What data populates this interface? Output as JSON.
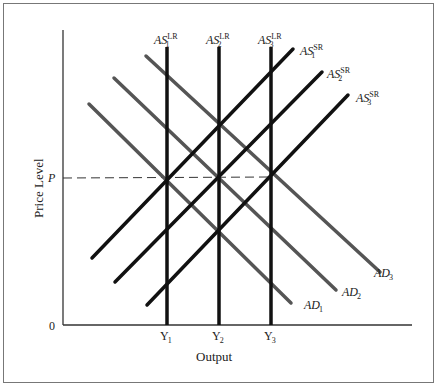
{
  "diagram": {
    "type": "AD-AS model",
    "y_axis_title": "Price Level",
    "x_axis_title": "Output",
    "origin_label": "0",
    "price_label": "P",
    "output_ticks": [
      {
        "base": "Y",
        "sub": "1"
      },
      {
        "base": "Y",
        "sub": "2"
      },
      {
        "base": "Y",
        "sub": "3"
      }
    ],
    "long_run_supply": [
      {
        "base": "AS",
        "sub": "1",
        "sup": "LR"
      },
      {
        "base": "AS",
        "sub": "2",
        "sup": "LR"
      },
      {
        "base": "AS",
        "sub": "3",
        "sup": "LR"
      }
    ],
    "short_run_supply": [
      {
        "base": "AS",
        "sub": "1",
        "sup": "SR"
      },
      {
        "base": "AS",
        "sub": "2",
        "sup": "SR"
      },
      {
        "base": "AS",
        "sub": "3",
        "sup": "SR"
      }
    ],
    "aggregate_demand": [
      {
        "base": "AD",
        "sub": "1"
      },
      {
        "base": "AD",
        "sub": "2"
      },
      {
        "base": "AD",
        "sub": "3"
      }
    ],
    "colors": {
      "supply_lines": "#111111",
      "demand_lines": "#555555",
      "axes": "#333333",
      "frame": "#777777",
      "dashed_price_line": "#333333"
    }
  }
}
